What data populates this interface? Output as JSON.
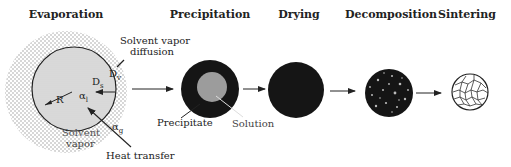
{
  "figure": {
    "stages": [
      {
        "id": "evaporation",
        "title": "Evaporation"
      },
      {
        "id": "precipitation",
        "title": "Precipitation"
      },
      {
        "id": "drying",
        "title": "Drying"
      },
      {
        "id": "decomposition",
        "title": "Decomposition"
      },
      {
        "id": "sintering",
        "title": "Sintering"
      }
    ],
    "evaporation_labels": {
      "solvent_vapor_diffusion_line1": "Solvent vapor",
      "solvent_vapor_diffusion_line2": "diffusion",
      "Dv": "D",
      "Dv_sub": "v",
      "Ds": "D",
      "Ds_sub": "s",
      "R": "R",
      "alpha_l": "α",
      "alpha_l_sub": "l",
      "alpha_g": "α",
      "alpha_g_sub": "g",
      "solvent_vapor_line1": "Solvent",
      "solvent_vapor_line2": "vapor",
      "heat_transfer": "Heat transfer"
    },
    "precipitation_labels": {
      "precipitate": "Precipitate",
      "solution": "Solution"
    },
    "colors": {
      "droplet_fill": "#d9d9d9",
      "halo_dots": "#9a9a9a",
      "particle_dark": "#151515",
      "solution_gray": "#9c9c9c",
      "line": "#222222"
    }
  }
}
